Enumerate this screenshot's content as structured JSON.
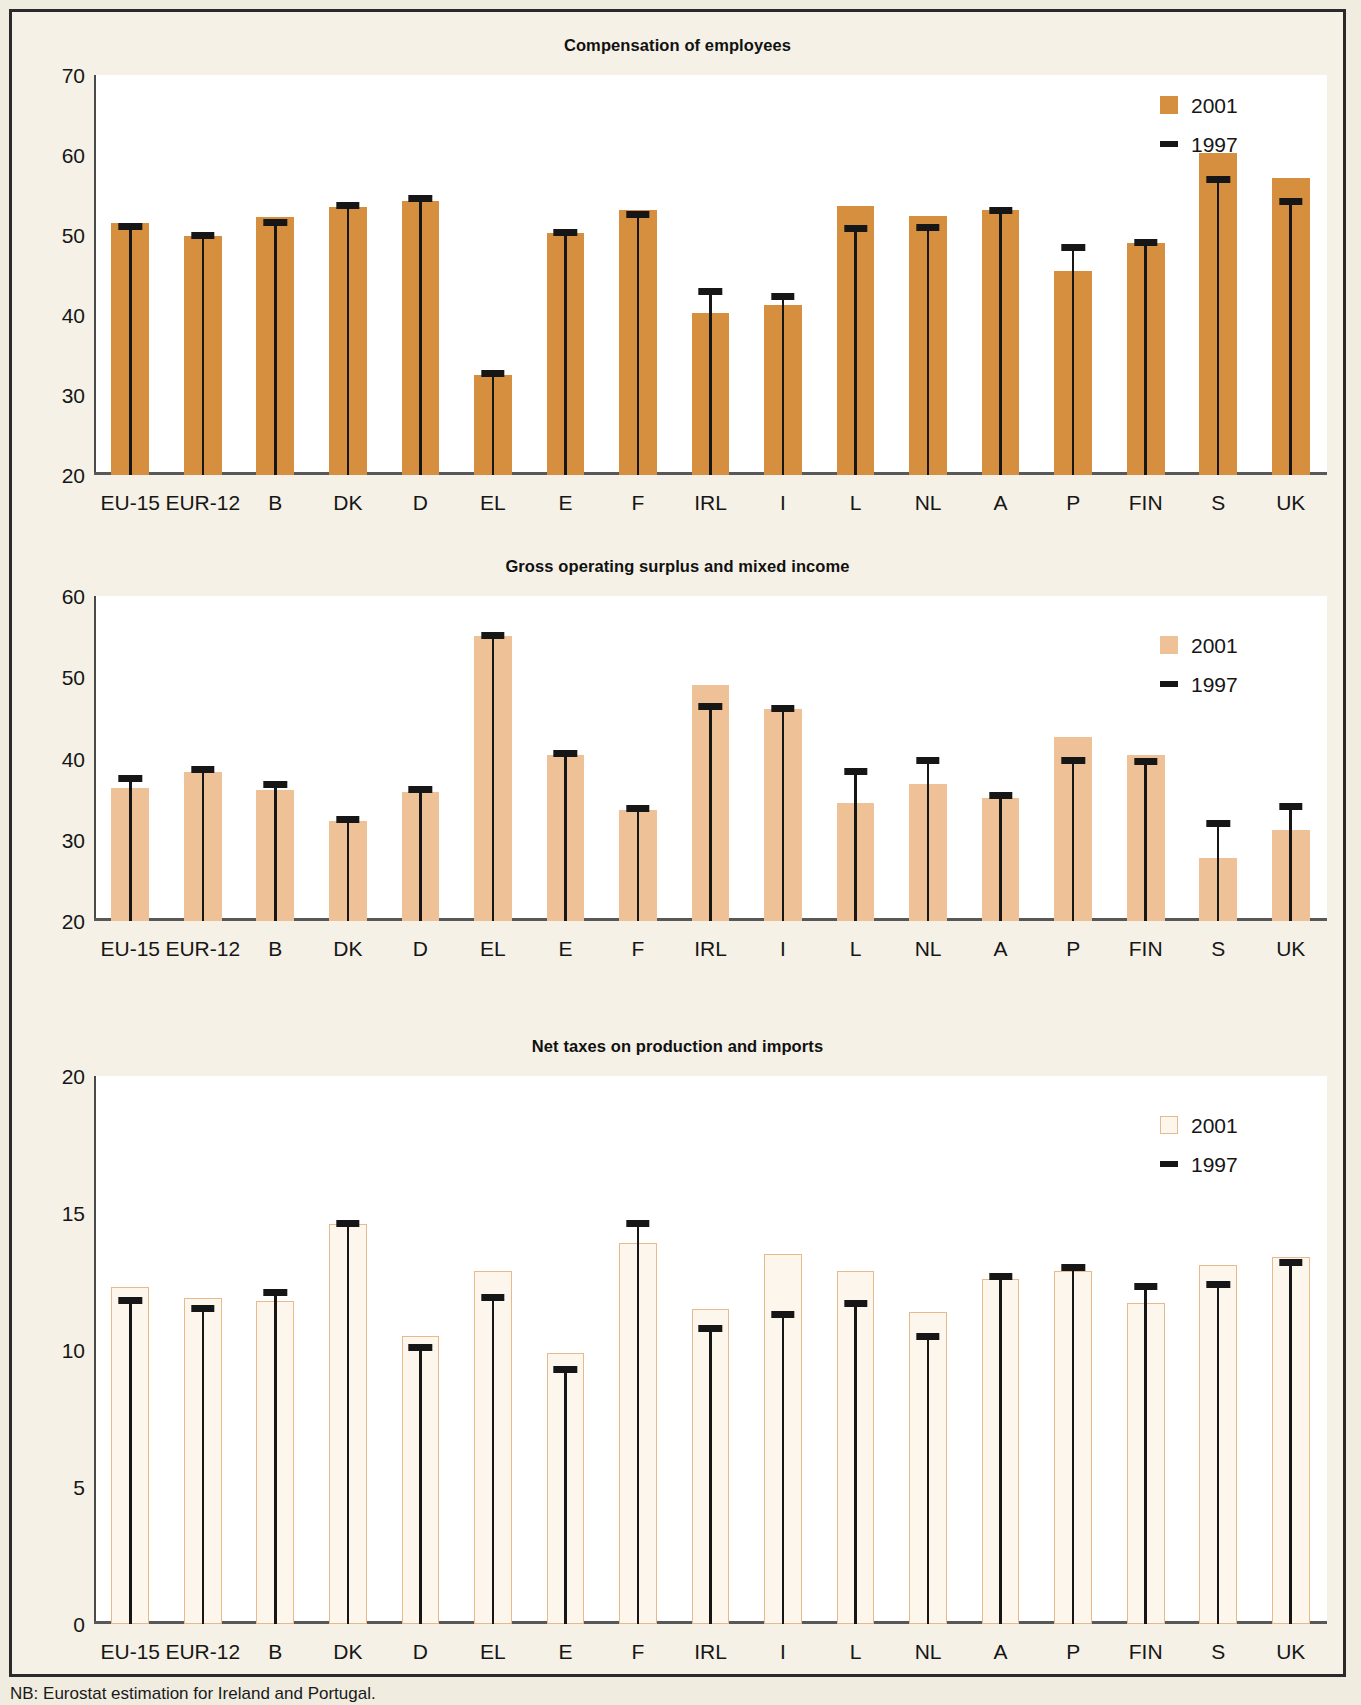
{
  "note": "NB: Eurostat estimation for Ireland and Portugal.",
  "legend": {
    "series_2001": "2001",
    "series_1997": "1997",
    "swatch_2001_icon": "square-swatch-icon",
    "swatch_1997_icon": "dash-marker-icon"
  },
  "colors": {
    "bar_dark": "#d68f3e",
    "bar_light": "#eec296",
    "bar_hollow_fill": "#fdf6ec",
    "bar_hollow_border": "#e8b98c",
    "marker": "#161616",
    "page_background": "#f5f1e6",
    "plot_background": "#ffffff"
  },
  "chart_data": [
    {
      "type": "bar",
      "title": "Compensation of employees",
      "xlabel": "",
      "ylabel": "",
      "ylim": [
        20,
        70
      ],
      "yticks": [
        20,
        30,
        40,
        50,
        60,
        70
      ],
      "grid": false,
      "legend_position": "top-right",
      "categories": [
        "EU-15",
        "EUR-12",
        "B",
        "DK",
        "D",
        "EL",
        "E",
        "F",
        "IRL",
        "I",
        "L",
        "NL",
        "A",
        "P",
        "FIN",
        "S",
        "UK"
      ],
      "series": [
        {
          "name": "2001",
          "style": "bar-solid-dark",
          "values": [
            51.5,
            49.9,
            52.3,
            53.5,
            54.3,
            32.5,
            50.3,
            53.1,
            40.2,
            41.3,
            53.6,
            52.4,
            53.1,
            45.5,
            49.0,
            60.3,
            57.1
          ]
        },
        {
          "name": "1997",
          "style": "marker",
          "values": [
            51.1,
            49.9,
            51.6,
            53.7,
            54.6,
            32.7,
            50.3,
            52.6,
            43.0,
            42.3,
            50.8,
            50.9,
            53.1,
            48.5,
            49.1,
            57.0,
            54.2
          ]
        }
      ]
    },
    {
      "type": "bar",
      "title": "Gross operating surplus and mixed income",
      "xlabel": "",
      "ylabel": "",
      "ylim": [
        20,
        60
      ],
      "yticks": [
        20,
        30,
        40,
        50,
        60
      ],
      "grid": false,
      "legend_position": "top-right",
      "categories": [
        "EU-15",
        "EUR-12",
        "B",
        "DK",
        "D",
        "EL",
        "E",
        "F",
        "IRL",
        "I",
        "L",
        "NL",
        "A",
        "P",
        "FIN",
        "S",
        "UK"
      ],
      "series": [
        {
          "name": "2001",
          "style": "bar-solid-light",
          "values": [
            36.4,
            38.4,
            36.1,
            32.3,
            35.9,
            55.1,
            40.4,
            33.7,
            49.1,
            46.1,
            34.5,
            36.9,
            35.2,
            42.6,
            40.4,
            27.8,
            31.2
          ]
        },
        {
          "name": "1997",
          "style": "marker",
          "values": [
            37.5,
            38.6,
            36.8,
            32.5,
            36.2,
            55.2,
            40.6,
            33.9,
            46.4,
            46.2,
            38.4,
            39.7,
            35.4,
            39.8,
            39.6,
            32.0,
            34.1
          ]
        }
      ]
    },
    {
      "type": "bar",
      "title": "Net taxes on production and imports",
      "xlabel": "",
      "ylabel": "",
      "ylim": [
        0,
        20
      ],
      "yticks": [
        0,
        5,
        10,
        15,
        20
      ],
      "grid": false,
      "legend_position": "top-right",
      "categories": [
        "EU-15",
        "EUR-12",
        "B",
        "DK",
        "D",
        "EL",
        "E",
        "F",
        "IRL",
        "I",
        "L",
        "NL",
        "A",
        "P",
        "FIN",
        "S",
        "UK"
      ],
      "series": [
        {
          "name": "2001",
          "style": "bar-hollow",
          "values": [
            12.3,
            11.9,
            11.8,
            14.6,
            10.5,
            12.9,
            9.9,
            13.9,
            11.5,
            13.5,
            12.9,
            11.4,
            12.6,
            12.9,
            11.7,
            13.1,
            13.4
          ]
        },
        {
          "name": "1997",
          "style": "marker",
          "values": [
            11.8,
            11.5,
            12.1,
            14.6,
            10.1,
            11.9,
            9.3,
            14.6,
            10.8,
            11.3,
            11.7,
            10.5,
            12.7,
            13.0,
            12.3,
            12.4,
            13.2
          ]
        }
      ]
    }
  ]
}
